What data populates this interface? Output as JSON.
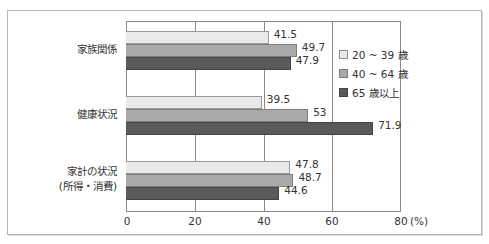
{
  "chart_data": {
    "type": "bar",
    "orientation": "horizontal",
    "title": "",
    "xlabel": "",
    "ylabel": "",
    "unit_label": "(%)",
    "categories": [
      "家族関係",
      "健康状況",
      "家計の状況\n(所得・消費)"
    ],
    "category_lines": [
      [
        "家族関係"
      ],
      [
        "健康状況"
      ],
      [
        "家計の状況",
        "(所得・消費)"
      ]
    ],
    "series": [
      {
        "name": "20 ~ 39 歳",
        "values": [
          41.5,
          39.5,
          47.8
        ],
        "color": "#e9e9e9"
      },
      {
        "name": "40 ~ 64 歳",
        "values": [
          49.7,
          53,
          48.7
        ],
        "color": "#a9a9a9"
      },
      {
        "name": "65 歳以上",
        "values": [
          47.9,
          71.9,
          44.6
        ],
        "color": "#5a5a5a"
      }
    ],
    "value_labels": [
      [
        "41.5",
        "49.7",
        "47.9"
      ],
      [
        "39.5",
        "53",
        "71.9"
      ],
      [
        "47.8",
        "48.7",
        "44.6"
      ]
    ],
    "xlim": [
      0,
      80
    ],
    "xticks": [
      0,
      20,
      40,
      60,
      80
    ],
    "xtick_labels": [
      "0",
      "20",
      "40",
      "60",
      "80"
    ],
    "grid": true,
    "legend_position": "inside-right"
  },
  "legend": {
    "items": [
      "20 ~ 39 歳",
      "40 ~ 64 歳",
      "65 歳以上"
    ]
  }
}
